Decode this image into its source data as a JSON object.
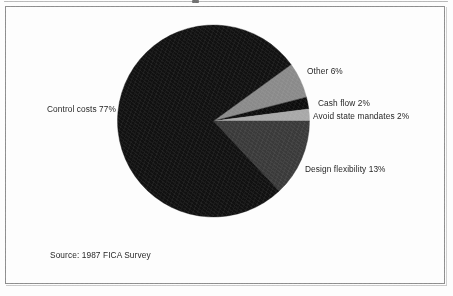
{
  "figure": {
    "background_color": "#fdfdfd",
    "frame_color": "#8d8d8d",
    "source_note": "Source: 1987 FICA Survey"
  },
  "chart_data": {
    "type": "pie",
    "title": "",
    "subtitle": "",
    "xlabel": "",
    "ylabel": "",
    "units": "percent",
    "total": 100,
    "legend_position": "none",
    "labels_position": "outside-callout",
    "grid": false,
    "start_angle_deg": -36,
    "direction": "clockwise",
    "categories": [
      "Other",
      "Cash flow",
      "Avoid state mandates",
      "Design flexibility",
      "Control costs"
    ],
    "values": [
      6,
      2,
      2,
      13,
      77
    ],
    "colors": [
      "#8a8a8a",
      "#0d0d0d",
      "#a8a8a8",
      "#3a3a3a",
      "#111111"
    ],
    "slices": [
      {
        "name": "Other",
        "value": 6,
        "label": "Other 6%",
        "color": "#8a8a8a"
      },
      {
        "name": "Cash flow",
        "value": 2,
        "label": "Cash flow 2%",
        "color": "#0d0d0d"
      },
      {
        "name": "Avoid state mandates",
        "value": 2,
        "label": "Avoid state mandates 2%",
        "color": "#a8a8a8"
      },
      {
        "name": "Design flexibility",
        "value": 13,
        "label": "Design flexibility 13%",
        "color": "#3a3a3a"
      },
      {
        "name": "Control costs",
        "value": 77,
        "label": "Control costs 77%",
        "color": "#111111"
      }
    ]
  },
  "labels": {
    "control_costs": "Control costs 77%",
    "other": "Other 6%",
    "cash_flow": "Cash flow 2%",
    "avoid_state_mandates": "Avoid state mandates 2%",
    "design_flexibility": "Design flexibility 13%"
  }
}
